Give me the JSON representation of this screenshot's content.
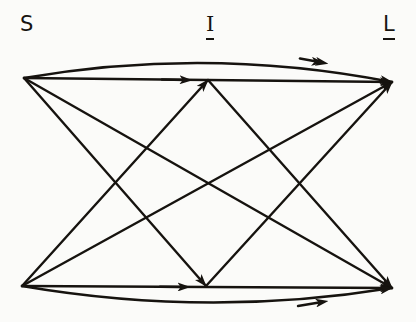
{
  "diagram": {
    "type": "directed-graph",
    "title": "",
    "background_color": "#fbfbf9",
    "line_color": "#16130f",
    "labels": [
      {
        "id": "s",
        "text": "S",
        "underlined": false,
        "serif": false,
        "x": 28,
        "y": 24
      },
      {
        "id": "i",
        "text": "I",
        "underlined": true,
        "serif": true,
        "x": 212,
        "y": 24
      },
      {
        "id": "l",
        "text": "L",
        "underlined": true,
        "serif": false,
        "x": 390,
        "y": 24
      }
    ],
    "nodes": [
      {
        "id": "s-top",
        "column": "S",
        "row": "top",
        "x": 24,
        "y": 78
      },
      {
        "id": "s-bottom",
        "column": "S",
        "row": "bottom",
        "x": 22,
        "y": 286
      },
      {
        "id": "i-top",
        "column": "I",
        "row": "top",
        "x": 208,
        "y": 80
      },
      {
        "id": "i-bottom",
        "column": "I",
        "row": "bottom",
        "x": 206,
        "y": 286
      },
      {
        "id": "l-top",
        "column": "L",
        "row": "top",
        "x": 392,
        "y": 82
      },
      {
        "id": "l-bottom",
        "column": "L",
        "row": "bottom",
        "x": 392,
        "y": 288
      }
    ],
    "edges": [
      {
        "id": "e1",
        "from": "s-top",
        "to": "l-top",
        "shape": "arc-up",
        "arrow_at": "middle-and-end"
      },
      {
        "id": "e2",
        "from": "s-top",
        "to": "l-top",
        "shape": "straight",
        "arrow_at": "middle-and-end"
      },
      {
        "id": "e3",
        "from": "s-top",
        "to": "i-bottom",
        "shape": "straight",
        "arrow_at": "end"
      },
      {
        "id": "e4",
        "from": "s-top",
        "to": "l-bottom",
        "shape": "straight",
        "arrow_at": "end"
      },
      {
        "id": "e5",
        "from": "s-bottom",
        "to": "i-top",
        "shape": "straight",
        "arrow_at": "end"
      },
      {
        "id": "e6",
        "from": "s-bottom",
        "to": "l-top",
        "shape": "straight",
        "arrow_at": "end"
      },
      {
        "id": "e7",
        "from": "s-bottom",
        "to": "l-bottom",
        "shape": "straight",
        "arrow_at": "middle-and-end"
      },
      {
        "id": "e8",
        "from": "s-bottom",
        "to": "l-bottom",
        "shape": "arc-down",
        "arrow_at": "middle-and-end"
      },
      {
        "id": "e9",
        "from": "i-top",
        "to": "l-bottom",
        "shape": "straight",
        "arrow_at": "end"
      },
      {
        "id": "e10",
        "from": "i-bottom",
        "to": "l-top",
        "shape": "straight",
        "arrow_at": "end"
      }
    ]
  }
}
